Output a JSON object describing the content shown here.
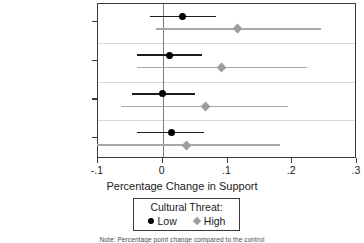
{
  "chart_data": {
    "type": "scatter",
    "title": "",
    "xlabel": "Percentage Change in Support",
    "ylabel": "",
    "xlim": [
      -0.1,
      0.3
    ],
    "ylim": [
      0,
      4
    ],
    "grid": "horizontal",
    "legend_position": "bottom",
    "legend_title": "Cultural Threat:",
    "xticks": [
      "-.1",
      "0",
      ".1",
      ".2",
      ".3"
    ],
    "xtick_values": [
      -0.1,
      0,
      0.1,
      0.2,
      0.3
    ],
    "categories": [
      "Long Time",
      "Psychological",
      "Not Know Reunion",
      "Adoption"
    ],
    "series": [
      {
        "name": "Low",
        "marker": "circle",
        "color": "#000000",
        "values": [
          0.031,
          0.01,
          0.0,
          0.013
        ],
        "ci_low": [
          -0.019,
          -0.039,
          -0.048,
          -0.039
        ],
        "ci_high": [
          0.082,
          0.061,
          0.05,
          0.063
        ]
      },
      {
        "name": "High",
        "marker": "diamond",
        "color": "#9d9d9d",
        "values": [
          0.115,
          0.09,
          0.066,
          0.037
        ],
        "ci_low": [
          -0.011,
          -0.04,
          -0.065,
          -0.102
        ],
        "ci_high": [
          0.244,
          0.223,
          0.194,
          0.181
        ]
      }
    ],
    "note": "Note: Percentage point change compared to the control"
  },
  "axis": {
    "x_title": "Percentage Change in Support",
    "tick_labels": [
      "-.1",
      "0",
      ".1",
      ".2",
      ".3"
    ],
    "category_labels": [
      "Long Time",
      "Psychological",
      "Not Know Reunion",
      "Adoption"
    ]
  },
  "legend": {
    "title": "Cultural Threat:",
    "items": [
      {
        "label": "Low",
        "marker": "circle-marker",
        "color": "#000000"
      },
      {
        "label": "High",
        "marker": "diamond-marker",
        "color": "#9d9d9d"
      }
    ]
  },
  "footer": {
    "note": "Note: Percentage point change compared to the control"
  }
}
